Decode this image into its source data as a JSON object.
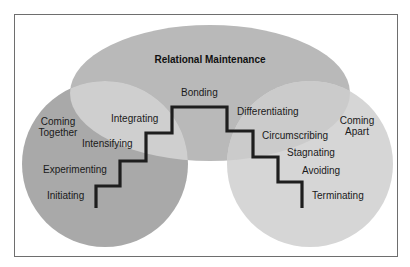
{
  "diagram": {
    "title": "Relational Maintenance",
    "regions": {
      "coming_together": [
        "Coming",
        "Together"
      ],
      "coming_apart": [
        "Coming",
        "Apart"
      ]
    },
    "stages": {
      "initiating": "Initiating",
      "experimenting": "Experimenting",
      "intensifying": "Intensifying",
      "integrating": "Integrating",
      "bonding": "Bonding",
      "differentiating": "Differentiating",
      "circumscribing": "Circumscribing",
      "stagnating": "Stagnating",
      "avoiding": "Avoiding",
      "terminating": "Terminating"
    },
    "colors": {
      "top_ellipse": "#b9b9b9",
      "left_circle": "#a9a9a9",
      "right_circle": "#d6d6d6",
      "overlap_left": "#cfcfcf",
      "overlap_right": "#cbcbcb",
      "stair": "#1e1e1e",
      "frame": "#6e6e6e"
    }
  }
}
